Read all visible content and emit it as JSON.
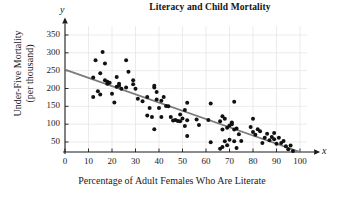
{
  "chart_data": {
    "type": "scatter",
    "title": "Literacy and Child Mortality",
    "xlabel": "Percentage of Adult Females Who Are Literate",
    "ylabel_line1": "Under-Five Mortality",
    "ylabel_line2": "(per thousand)",
    "x_axis_letter": "x",
    "y_axis_letter": "y",
    "xlim": [
      0,
      100
    ],
    "ylim": [
      0,
      375
    ],
    "xticks": [
      0,
      10,
      20,
      30,
      40,
      50,
      60,
      70,
      80,
      90,
      100
    ],
    "yticks": [
      50,
      100,
      150,
      200,
      250,
      300,
      350
    ],
    "grid": true,
    "legend": "none",
    "point_color": "#111111",
    "line_color": "#7a7a7a",
    "grid_color": "#e6e6e6",
    "axis_color": "#1a1a1a",
    "trend_line": {
      "x1": 0,
      "y1": 253,
      "x2": 100,
      "y2": 22
    },
    "points": [
      [
        12,
        231
      ],
      [
        12,
        176
      ],
      [
        13,
        279
      ],
      [
        14,
        192
      ],
      [
        15,
        243
      ],
      [
        15,
        183
      ],
      [
        16,
        302
      ],
      [
        17,
        223
      ],
      [
        17,
        270
      ],
      [
        18,
        219
      ],
      [
        18,
        213
      ],
      [
        19,
        216
      ],
      [
        20,
        185
      ],
      [
        21,
        161
      ],
      [
        22,
        232
      ],
      [
        22,
        205
      ],
      [
        23,
        213
      ],
      [
        23,
        208
      ],
      [
        24,
        199
      ],
      [
        26,
        279
      ],
      [
        26,
        203
      ],
      [
        27,
        247
      ],
      [
        29,
        223
      ],
      [
        29,
        212
      ],
      [
        30,
        199
      ],
      [
        31,
        171
      ],
      [
        33,
        164
      ],
      [
        35,
        176
      ],
      [
        35,
        124
      ],
      [
        36,
        145
      ],
      [
        37,
        120
      ],
      [
        38,
        86
      ],
      [
        38,
        208
      ],
      [
        38,
        203
      ],
      [
        39,
        190
      ],
      [
        39,
        169
      ],
      [
        40,
        145
      ],
      [
        41,
        166
      ],
      [
        41,
        120
      ],
      [
        42,
        176
      ],
      [
        43,
        151
      ],
      [
        44,
        150
      ],
      [
        45,
        120
      ],
      [
        46,
        110
      ],
      [
        47,
        112
      ],
      [
        48,
        109
      ],
      [
        49,
        127
      ],
      [
        49,
        108
      ],
      [
        50,
        116
      ],
      [
        51,
        140
      ],
      [
        51,
        95
      ],
      [
        52,
        160
      ],
      [
        52,
        111
      ],
      [
        52,
        67
      ],
      [
        56,
        113
      ],
      [
        57,
        98
      ],
      [
        61,
        112
      ],
      [
        62,
        158
      ],
      [
        62,
        49
      ],
      [
        66,
        108
      ],
      [
        66,
        31
      ],
      [
        67,
        122
      ],
      [
        67,
        85
      ],
      [
        67,
        36
      ],
      [
        68,
        115
      ],
      [
        68,
        52
      ],
      [
        69,
        90
      ],
      [
        69,
        41
      ],
      [
        70,
        96
      ],
      [
        70,
        56
      ],
      [
        71,
        105
      ],
      [
        71,
        100
      ],
      [
        72,
        163
      ],
      [
        72,
        85
      ],
      [
        72,
        52
      ],
      [
        73,
        88
      ],
      [
        73,
        33
      ],
      [
        74,
        72
      ],
      [
        75,
        53
      ],
      [
        79,
        92
      ],
      [
        80,
        115
      ],
      [
        80,
        78
      ],
      [
        81,
        70
      ],
      [
        82,
        86
      ],
      [
        83,
        80
      ],
      [
        84,
        47
      ],
      [
        85,
        62
      ],
      [
        86,
        73
      ],
      [
        87,
        55
      ],
      [
        88,
        64
      ],
      [
        89,
        75
      ],
      [
        89,
        58
      ],
      [
        90,
        45
      ],
      [
        91,
        62
      ],
      [
        92,
        47
      ],
      [
        93,
        53
      ],
      [
        94,
        38
      ],
      [
        95,
        30
      ],
      [
        96,
        40
      ],
      [
        97,
        25
      ]
    ]
  }
}
